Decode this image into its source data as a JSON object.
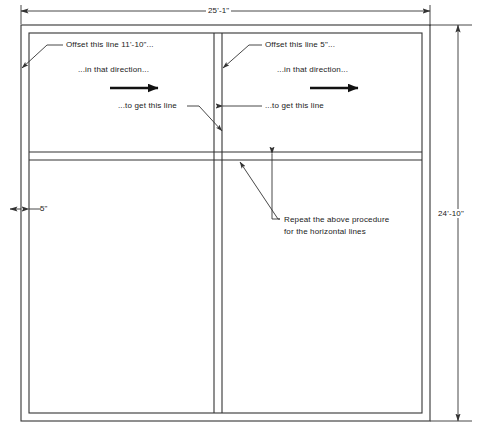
{
  "drawing": {
    "title": "floor-plan-offset-instructions",
    "line_color": "#333333",
    "text_color": "#1a1a1a",
    "background": "#ffffff"
  },
  "dimensions": {
    "overall_width": "25'-1\"",
    "overall_height": "24'-10\"",
    "wall_thickness": "5\""
  },
  "annotations": {
    "left": {
      "line1": "Offset this line 11'-10\"...",
      "line2": "...in that direction...",
      "line3": "...to get this line"
    },
    "right": {
      "line1": "Offset this line 5\"...",
      "line2": "...in that direction...",
      "line3": "...to get this line"
    },
    "bottom": {
      "line1": "Repeat the above procedure",
      "line2": "for the horizontal lines"
    }
  }
}
